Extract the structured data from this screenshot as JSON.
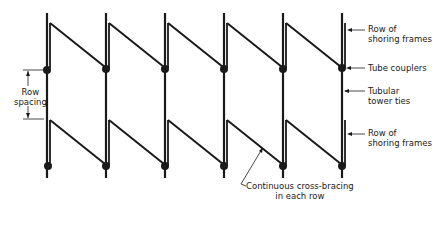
{
  "diagram": {
    "columns_x": [
      47,
      106,
      165,
      224,
      283,
      342
    ],
    "rows": [
      {
        "name": "top-row",
        "post_top": 13,
        "brace_top": 23,
        "coupler_y": 70
      },
      {
        "name": "bottom-row",
        "brace_top": 120,
        "coupler_y": 166,
        "post_bottom": 178
      }
    ],
    "colors": {
      "ink": "#1a1a1a",
      "background": "#ffffff"
    }
  },
  "labels": {
    "row_spacing_line1": "Row",
    "row_spacing_line2": "spacing",
    "row_of_shoring_frames_top_1": "Row of",
    "row_of_shoring_frames_top_2": "shoring frames",
    "tube_couplers": "Tube couplers",
    "tubular_tower_ties_1": "Tubular",
    "tubular_tower_ties_2": "tower ties",
    "row_of_shoring_frames_bottom_1": "Row of",
    "row_of_shoring_frames_bottom_2": "shoring frames",
    "continuous_bracing_1": "Continuous cross-bracing",
    "continuous_bracing_2": "in each row"
  }
}
